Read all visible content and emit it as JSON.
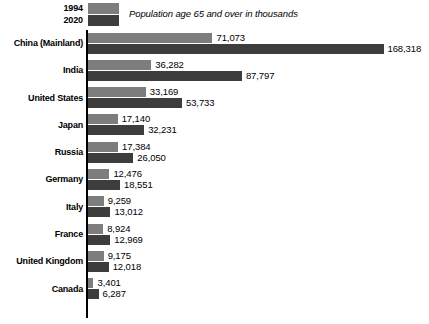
{
  "legend": {
    "items": [
      {
        "year": "1994",
        "color": "#7d7d7d"
      },
      {
        "year": "2020",
        "color": "#3d3d3d"
      }
    ],
    "caption": "Population age 65 and over in thousands"
  },
  "chart_data": {
    "type": "bar",
    "orientation": "horizontal",
    "title": "",
    "subtitle": "Population age 65 and over in thousands",
    "xlabel": "",
    "ylabel": "",
    "grid": false,
    "legend_position": "top-left",
    "xlim": [
      0,
      168318
    ],
    "categories": [
      "China (Mainland)",
      "India",
      "United States",
      "Japan",
      "Russia",
      "Germany",
      "Italy",
      "France",
      "United Kingdom",
      "Canada"
    ],
    "series": [
      {
        "name": "1994",
        "color": "#7d7d7d",
        "values": [
          71073,
          36282,
          33169,
          17140,
          17384,
          12476,
          9259,
          8924,
          9175,
          3401
        ],
        "labels": [
          "71,073",
          "36,282",
          "33,169",
          "17,140",
          "17,384",
          "12,476",
          "9,259",
          "8,924",
          "9,175",
          "3,401"
        ]
      },
      {
        "name": "2020",
        "color": "#3d3d3d",
        "values": [
          168318,
          87797,
          53733,
          32231,
          26050,
          18551,
          13012,
          12969,
          12018,
          6287
        ],
        "labels": [
          "168,318",
          "87,797",
          "53,733",
          "32,231",
          "26,050",
          "18,551",
          "13,012",
          "12,969",
          "12,018",
          "6,287"
        ]
      }
    ]
  }
}
